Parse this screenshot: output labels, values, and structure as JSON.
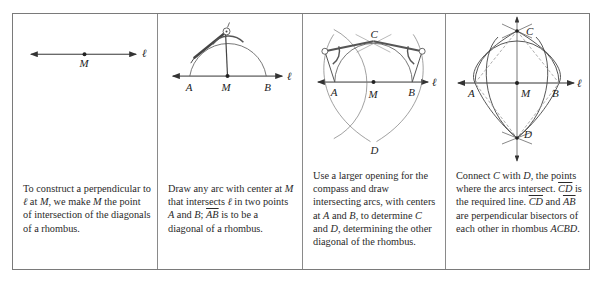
{
  "panels": [
    {
      "id": "step-1",
      "labels": {
        "point_m": "M",
        "line": "ℓ"
      },
      "caption": {
        "t1": "To construct a perpendicular to ",
        "l": "ℓ",
        "t2": " at ",
        "m1": "M",
        "t3": ", we make ",
        "m2": "M",
        "t4": " the point of intersection of the diagonals of a rhombus."
      }
    },
    {
      "id": "step-2",
      "labels": {
        "point_a": "A",
        "point_m": "M",
        "point_b": "B",
        "line": "ℓ"
      },
      "caption": {
        "t1": "Draw any arc with center at ",
        "m": "M",
        "t2": " that intersects ",
        "l": "ℓ",
        "t3": " in two points ",
        "a": "A",
        "t4": " and ",
        "b": "B",
        "t5": "; ",
        "ab": "AB",
        "t6": " is to be a diagonal of a rhombus."
      }
    },
    {
      "id": "step-3",
      "labels": {
        "point_a": "A",
        "point_m": "M",
        "point_b": "B",
        "point_c": "C",
        "point_d": "D",
        "line": "ℓ"
      },
      "caption": {
        "t1": "Use a larger opening for the compass and draw intersecting arcs, with centers at ",
        "a": "A",
        "t2": " and ",
        "b": "B",
        "t3": ", to determine ",
        "c": "C",
        "t4": " and ",
        "d": "D",
        "t5": ", determining the other diagonal of the rhombus."
      }
    },
    {
      "id": "step-4",
      "labels": {
        "point_a": "A",
        "point_m": "M",
        "point_b": "B",
        "point_c": "C",
        "point_d": "D",
        "line": "ℓ"
      },
      "caption": {
        "t1": "Connect ",
        "c": "C",
        "t2": " with ",
        "d": "D",
        "t3": ", the points where the arcs intersect. ",
        "cd_line": "CD",
        "t4": " is the required line. ",
        "cd": "CD",
        "t5": " and ",
        "ab": "AB",
        "t6": " are perpendicular bisectors of each other in rhombus ",
        "rh": "ACBD",
        "t7": "."
      }
    }
  ],
  "colors": {
    "line": "#333333",
    "border": "#7a7a7a",
    "arc": "#555555",
    "dashed": "#999999"
  }
}
